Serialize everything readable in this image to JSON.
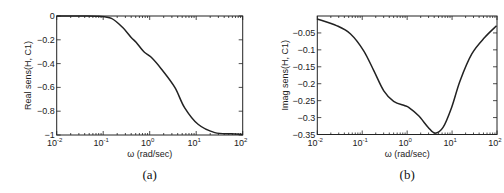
{
  "chart_data": [
    {
      "id": "a",
      "type": "line",
      "caption": "(a)",
      "title": "",
      "xlabel": "ω (rad/sec)",
      "ylabel": "Real sens(H, C1)",
      "xscale": "log",
      "xlim": [
        0.01,
        100
      ],
      "ylim": [
        -1,
        0
      ],
      "grid": false,
      "legend": null,
      "x_ticks": [
        {
          "base": "10",
          "exp": "-2",
          "value": 0.01
        },
        {
          "base": "10",
          "exp": "-1",
          "value": 0.1
        },
        {
          "base": "10",
          "exp": "0",
          "value": 1
        },
        {
          "base": "10",
          "exp": "1",
          "value": 10
        },
        {
          "base": "10",
          "exp": "2",
          "value": 100
        }
      ],
      "y_ticks": [
        "0",
        "-0.2",
        "-0.4",
        "-0.6",
        "-0.8",
        "-1"
      ],
      "y_tick_values": [
        0,
        -0.2,
        -0.4,
        -0.6,
        -0.8,
        -1
      ],
      "series": [
        {
          "name": "Real sens(H, C1)",
          "x": [
            0.01,
            0.03,
            0.08,
            0.15,
            0.26,
            0.4,
            0.51,
            0.75,
            1.08,
            1.78,
            3.47,
            5.62,
            10.96,
            25.1,
            56.2,
            100
          ],
          "y": [
            0,
            0,
            -0.002,
            -0.02,
            -0.095,
            -0.18,
            -0.22,
            -0.3,
            -0.347,
            -0.445,
            -0.6,
            -0.77,
            -0.91,
            -0.98,
            -0.99,
            -0.995
          ]
        }
      ]
    },
    {
      "id": "b",
      "type": "line",
      "caption": "(b)",
      "title": "",
      "xlabel": "ω (rad/sec)",
      "ylabel": "Imag sens(H, C1)",
      "xscale": "log",
      "xlim": [
        0.01,
        100
      ],
      "ylim": [
        -0.35,
        0
      ],
      "grid": false,
      "legend": null,
      "x_ticks": [
        {
          "base": "10",
          "exp": "-2",
          "value": 0.01
        },
        {
          "base": "10",
          "exp": "-1",
          "value": 0.1
        },
        {
          "base": "10",
          "exp": "0",
          "value": 1
        },
        {
          "base": "10",
          "exp": "1",
          "value": 10
        },
        {
          "base": "10",
          "exp": "2",
          "value": 100
        }
      ],
      "y_ticks": [
        "-0.05",
        "-0.1",
        "-0.15",
        "-0.2",
        "-0.25",
        "-0.3",
        "-0.35"
      ],
      "y_tick_values": [
        -0.05,
        -0.1,
        -0.15,
        -0.2,
        -0.25,
        -0.3,
        -0.35
      ],
      "series": [
        {
          "name": "Imag sens(H, C1)",
          "x": [
            0.01,
            0.0275,
            0.055,
            0.107,
            0.182,
            0.302,
            0.5,
            0.89,
            1.08,
            1.78,
            2.95,
            4.17,
            6.3,
            9.77,
            15.1,
            27.5,
            53.7,
            97.7
          ],
          "y": [
            -0.009,
            -0.029,
            -0.053,
            -0.102,
            -0.162,
            -0.221,
            -0.252,
            -0.265,
            -0.27,
            -0.294,
            -0.329,
            -0.346,
            -0.329,
            -0.27,
            -0.191,
            -0.112,
            -0.063,
            -0.029
          ]
        }
      ]
    }
  ]
}
